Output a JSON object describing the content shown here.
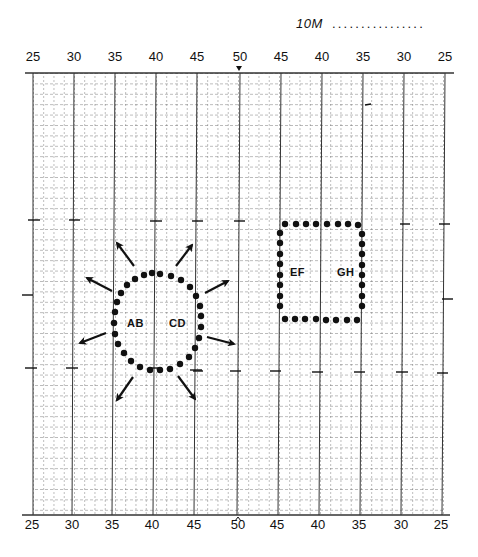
{
  "scale": {
    "label": "10M",
    "fill": "................"
  },
  "axis": {
    "top_labels": [
      "25",
      "30",
      "35",
      "40",
      "45",
      "50",
      "45",
      "40",
      "35",
      "30",
      "25"
    ],
    "bottom_labels": [
      "25",
      "30",
      "35",
      "40",
      "45",
      "50",
      "45",
      "40",
      "35",
      "30",
      "25"
    ],
    "center_marker_top": "▾",
    "center_marker_bottom": "^"
  },
  "shapes": {
    "circle": {
      "labels": [
        "AB",
        "CD"
      ],
      "arrows": 8,
      "dot_count": 30
    },
    "square": {
      "labels": [
        "EF",
        "GH"
      ],
      "dot_count": 30
    }
  },
  "colors": {
    "ink": "#111111",
    "grid_minor": "#555555",
    "grid_major": "#333333",
    "background": "#ffffff"
  }
}
